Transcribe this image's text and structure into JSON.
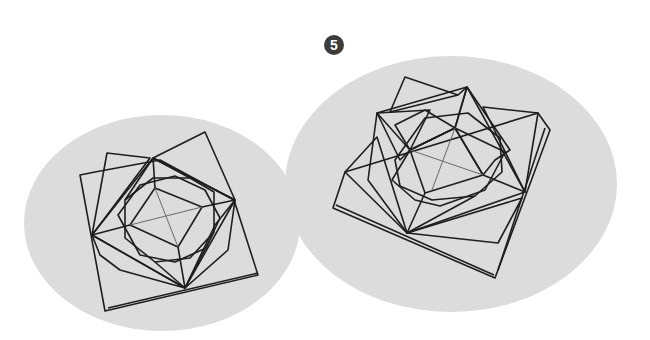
{
  "diagram": {
    "type": "origami-instruction-step",
    "step_number": "5",
    "colors": {
      "background": "#ffffff",
      "ellipse_fill": "#dcdcdc",
      "paper_back": "#a9a9a9",
      "paper_mid": "#c8c8c8",
      "paper_front": "#ffffff",
      "outline": "#1e1e1e",
      "badge": "#3c3c3c"
    },
    "views": [
      {
        "id": "left-view",
        "description": "Origami rose, top view (smaller, earlier state)"
      },
      {
        "id": "right-view",
        "description": "Origami rose, top view (larger, result state)"
      }
    ]
  }
}
